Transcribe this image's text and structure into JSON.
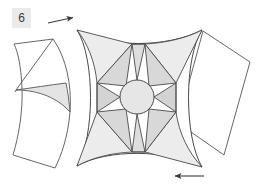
{
  "figure": {
    "label": "6",
    "label_background": "#eaeaea",
    "label_text_color": "#3a3a3a",
    "background": "#ffffff",
    "stroke_color": "#4a4a4a",
    "shade_light": "#ededed",
    "shade_mid": "#e2e2e2",
    "shade_dark": "#d4d4d4",
    "fill_white": "#ffffff",
    "annotations": [
      {
        "name": "top-rotation-arrow",
        "direction": "right",
        "x1": 48,
        "y1": 23,
        "x2": 75,
        "y2": 17
      },
      {
        "name": "bottom-rotation-arrow",
        "direction": "left",
        "x1": 204,
        "y1": 176,
        "x2": 173,
        "y2": 176
      }
    ],
    "center_circle": {
      "cx": 137,
      "cy": 97,
      "r": 17,
      "fill": "#e6e6e6"
    },
    "star_points": 8,
    "parts": [
      {
        "name": "left-detached-piece",
        "fill": "#ffffff"
      },
      {
        "name": "left-shaded-wedge",
        "fill": "#e4e4e4"
      },
      {
        "name": "main-astroid-body",
        "fill": "#ffffff"
      },
      {
        "name": "right-detached-quad",
        "fill": "#ffffff"
      }
    ]
  }
}
